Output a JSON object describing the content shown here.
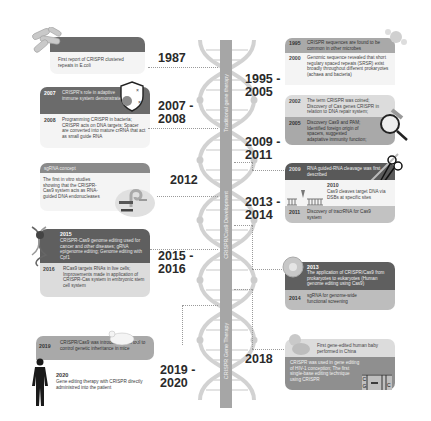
{
  "helix": {
    "eras": [
      {
        "label": "Traditional gene therapy"
      },
      {
        "label": "CRISPR/Cas9 Development"
      },
      {
        "label": "CRISPR Gene Therapy"
      }
    ]
  },
  "left": {
    "period_1987": {
      "year": "1987",
      "text": "First report of CRISPR clustered repeats in E.coli",
      "icon": "bacteria-icon"
    },
    "period_2007": {
      "year": "2007 -\n2008",
      "events": [
        {
          "year": "2007",
          "text": "CRISPR's role in adaptive immune system demonstrated"
        },
        {
          "year": "2008",
          "text": "Programming CRISPR in bacteria; CRISPR acts on DNA targets; Spacer are converted into mature crRNA that act as small guide RNA"
        }
      ],
      "icon": "shield-virus-icon"
    },
    "period_2012": {
      "year": "2012",
      "header": "sgRNA concept",
      "text": "The first in vitro studies showing that the CRISPR-Cas9 system acts as RNA-guided DNA endonucleases",
      "icon": "sgrna-complex-icon"
    },
    "period_2015": {
      "year": "2015 -\n2016",
      "events": [
        {
          "year": "2015",
          "text": "CRISPR-Cas9 genome editing used for cancer and other diseases; gRNA epigenome editing; Genome editing with Cpf1"
        },
        {
          "year": "2016",
          "text": "RCas9 targets RNAs in live cells; Improvements made in application of CRISPR-Cas system in embryonic stem cell system"
        }
      ],
      "icon": "dna-strand-icon"
    },
    "period_2019": {
      "year": "2019 -\n2020",
      "events": [
        {
          "year": "2019",
          "text": "CRISPR/Cas9 was introduced as a tool to control genetic inheritance in mice"
        },
        {
          "year": "2020",
          "text": "Gene editing therapy with CRISPR directly administred into the patient"
        }
      ],
      "icons": [
        "mouse-icon",
        "human-figure-icon"
      ]
    }
  },
  "right": {
    "period_1995": {
      "year": "1995 -\n2005",
      "events": [
        {
          "year": "1995",
          "text": "CRISPR sequences are found to be common in other microbes"
        },
        {
          "year": "2000",
          "text": "Genomic sequence revealed that short regulary spaced repeats (SRSR) exist broadly throughout different prokaryotes (achaea and bacteria)"
        },
        {
          "year": "2002",
          "text": "The term CRISPR was coined; Discovery of Cas genes CRISPR in relation to DNA repair system;"
        },
        {
          "year": "2005",
          "text": "Discovery Cas9 and PAM; Identified foreign origin of spacers, suggested adaptative immunity function;"
        }
      ],
      "icons": [
        "microbe-icon",
        "magnifier-dna-icon"
      ]
    },
    "period_2009": {
      "year": "2009 -\n2011",
      "events": [
        {
          "year": "2009",
          "text": "RNA guided-RNA cleavage was first described"
        },
        {
          "year": "2010",
          "text": "Cas9 cleaves target DNA via DSBs at specific sites"
        },
        {
          "year": "2011",
          "text": "Discovery of tracrRNA for Cas9 system"
        }
      ],
      "icons": [
        "scissors-dna-icon",
        "dsb-cut-icon"
      ]
    },
    "period_2013": {
      "year": "2013 -\n2014",
      "events": [
        {
          "year": "2013",
          "text": "The application of CRISPR/Cas9 from prokaryotes to eukaryotes (Human genome editing using Cas9)"
        },
        {
          "year": "2014",
          "text": "sgRNA for genome-wide functional screening"
        }
      ],
      "icon": "cell-icon"
    },
    "period_2018": {
      "year": "2018",
      "events": [
        {
          "year": "",
          "text": "First gene-edited human baby performed in China"
        },
        {
          "year": "",
          "text": "CRISPR was used in gene editing of HIV-1 conception; The first single-base editing technique using CRISPR"
        }
      ],
      "icons": [
        "baby-icon",
        "base-edit-icon"
      ],
      "base_letters": [
        "C",
        "G",
        "C"
      ]
    }
  },
  "colors": {
    "dark_card": "#6b6b6b",
    "mid_card": "#a9a9a9",
    "light_card": "#dcdcdc",
    "helix": "#cfcfcf",
    "spine": "#a6a6a6"
  }
}
